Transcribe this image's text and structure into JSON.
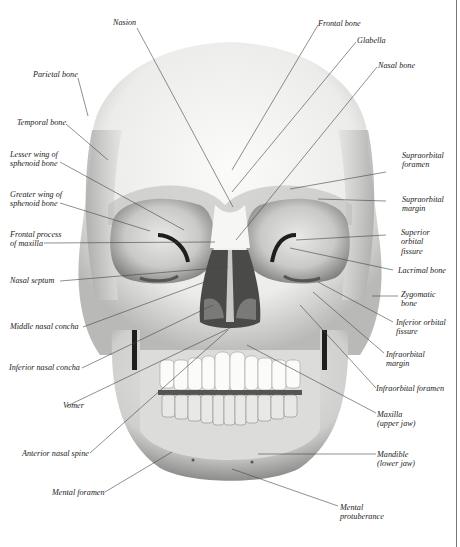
{
  "figure": {
    "colors": {
      "background": "#ffffff",
      "bone_light": "#f4f4f2",
      "bone_mid": "#d8d8d6",
      "bone_shadow": "#9a9a98",
      "cavity": "#3a3a3a",
      "leader_line": "#444444",
      "label_text": "#222222"
    }
  },
  "labels": {
    "nasion": {
      "lines": [
        "Nasion"
      ]
    },
    "frontal_bone": {
      "lines": [
        "Frontal bone"
      ]
    },
    "glabella": {
      "lines": [
        "Glabella"
      ]
    },
    "nasal_bone": {
      "lines": [
        "Nasal bone"
      ]
    },
    "parietal_bone": {
      "lines": [
        "Parietal bone"
      ]
    },
    "temporal_bone": {
      "lines": [
        "Temporal bone"
      ]
    },
    "lesser_wing": {
      "lines": [
        "Lesser wing of",
        "sphenoid bone"
      ]
    },
    "greater_wing": {
      "lines": [
        "Greater wing of",
        "sphenoid bone"
      ]
    },
    "frontal_process": {
      "lines": [
        "Frontal process",
        "of maxilla"
      ]
    },
    "nasal_septum": {
      "lines": [
        "Nasal septum"
      ]
    },
    "middle_nasal_concha": {
      "lines": [
        "Middle nasal concha"
      ]
    },
    "inferior_nasal_concha": {
      "lines": [
        "Inferior nasal concha"
      ]
    },
    "vomer": {
      "lines": [
        "Vomer"
      ]
    },
    "anterior_nasal_spine": {
      "lines": [
        "Anterior nasal spine"
      ]
    },
    "mental_foramen": {
      "lines": [
        "Mental foramen"
      ]
    },
    "supraorbital_foramen": {
      "lines": [
        "Supraorbital",
        "foramen"
      ]
    },
    "supraorbital_margin": {
      "lines": [
        "Supraorbital",
        "margin"
      ]
    },
    "superior_orbital_fissure": {
      "lines": [
        "Superior",
        "orbital",
        "fissure"
      ]
    },
    "lacrimal_bone": {
      "lines": [
        "Lacrimal bone"
      ]
    },
    "zygomatic_bone": {
      "lines": [
        "Zygomatic",
        "bone"
      ]
    },
    "inferior_orbital_fissure": {
      "lines": [
        "Inferior orbital",
        "fissure"
      ]
    },
    "infraorbital_margin": {
      "lines": [
        "Infraorbital",
        "margin"
      ]
    },
    "infraorbital_foramen": {
      "lines": [
        "Infraorbital foramen"
      ]
    },
    "maxilla": {
      "lines": [
        "Maxilla",
        "(upper jaw)"
      ]
    },
    "mandible": {
      "lines": [
        "Mandible",
        "(lower jaw)"
      ]
    },
    "mental_protuberance": {
      "lines": [
        "Mental",
        "protuberance"
      ]
    }
  }
}
